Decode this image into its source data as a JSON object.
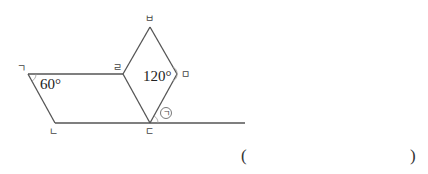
{
  "figure": {
    "vertices": {
      "giyeok": {
        "label": "ㄱ",
        "x": 28,
        "y": 74
      },
      "nieun": {
        "label": "ㄴ",
        "x": 55,
        "y": 123
      },
      "digeut": {
        "label": "ㄷ",
        "x": 150,
        "y": 123
      },
      "rieul": {
        "label": "ㄹ",
        "x": 123,
        "y": 74
      },
      "mieum": {
        "label": "ㅁ",
        "x": 177,
        "y": 74
      },
      "bieup": {
        "label": "ㅂ",
        "x": 150,
        "y": 27
      }
    },
    "angles": {
      "giyeok_angle": "60°",
      "mieum_angle": "120°"
    },
    "unknown_marker": "ㄱ",
    "shapes": [
      "parallelogram ㄱㄴㄷㄹ",
      "rhombus ㄹㄷㅁㅂ"
    ]
  },
  "answer": {
    "open_paren": "(",
    "close_paren": ")",
    "value": ""
  },
  "colors": {
    "line": "#555555",
    "text": "#222222"
  }
}
